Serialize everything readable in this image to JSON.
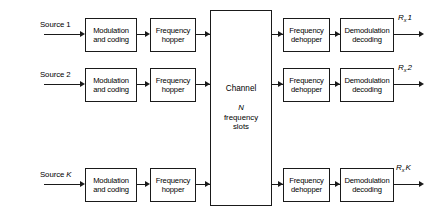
{
  "diagram": {
    "rows": [
      {
        "source_label": "Source 1",
        "source_label_prefix": "Source ",
        "source_label_index": "1",
        "tx_modulation": "Modulation\nand coding",
        "tx_hopper": "Frequency\nhopper",
        "rx_dehopper": "Frequency\ndehopper",
        "rx_demodulation": "Demodulation\ndecoding",
        "output_symbol": "R",
        "output_subscript": "x",
        "output_index": "1"
      },
      {
        "source_label": "Source 2",
        "source_label_prefix": "Source ",
        "source_label_index": "2",
        "tx_modulation": "Modulation\nand coding",
        "tx_hopper": "Frequency\nhopper",
        "rx_dehopper": "Frequency\ndehopper",
        "rx_demodulation": "Demodulation\ndecoding",
        "output_symbol": "R",
        "output_subscript": "x",
        "output_index": "2"
      },
      {
        "source_label": "Source K",
        "source_label_prefix": "Source ",
        "source_label_index": "K",
        "tx_modulation": "Modulation\nand coding",
        "tx_hopper": "Frequency\nhopper",
        "rx_dehopper": "Frequency\ndehopper",
        "rx_demodulation": "Demodulation\ndecoding",
        "output_symbol": "R",
        "output_subscript": "x",
        "output_index": "K"
      }
    ],
    "channel": {
      "title": "Channel",
      "variable": "N",
      "subtitle": "frequency\nslots"
    },
    "colors": {
      "stroke": "#1a1a1a",
      "background": "#ffffff",
      "text": "#000000"
    }
  }
}
